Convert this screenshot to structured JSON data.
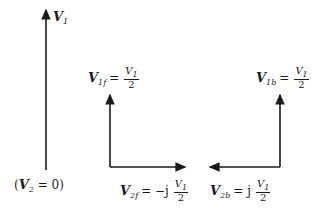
{
  "diagram": {
    "labels": {
      "v1": {
        "symbol": "V",
        "sub": "1"
      },
      "v2_zero": {
        "open": "(",
        "symbol": "V",
        "sub": "2",
        "rest": " = 0)"
      },
      "v1f": {
        "symbol": "V",
        "sub": "1f",
        "eq": "=",
        "num_symbol": "V",
        "num_sub": "1",
        "den": "2"
      },
      "v1b": {
        "symbol": "V",
        "sub": "1b",
        "eq": "=",
        "num_symbol": "V",
        "num_sub": "1",
        "den": "2"
      },
      "v2f": {
        "symbol": "V",
        "sub": "2f",
        "eq": "= −j",
        "num_symbol": "V",
        "num_sub": "1",
        "den": "2"
      },
      "v2b": {
        "symbol": "V",
        "sub": "2b",
        "eq": "= j",
        "num_symbol": "V",
        "num_sub": "1",
        "den": "2"
      }
    },
    "colors": {
      "stroke": "#1a1a1a"
    }
  }
}
